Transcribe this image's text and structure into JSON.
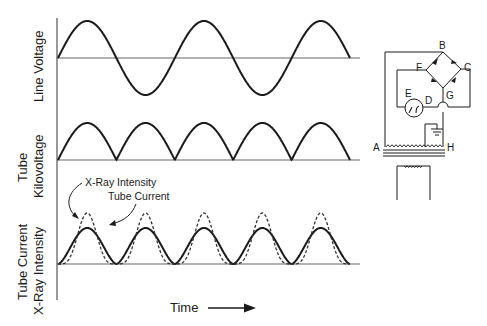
{
  "figure": {
    "type": "waveform-diagram",
    "x_axis_label": "Time",
    "panels": [
      {
        "id": "line-voltage",
        "label": "Line Voltage",
        "waveform": "full sine (AC)",
        "cycles": 2.5
      },
      {
        "id": "tube-kilovoltage",
        "label_line1": "Tube",
        "label_line2": "Kilovoltage",
        "waveform": "full-wave rectified sine",
        "pulses": 5
      },
      {
        "id": "current-intensity",
        "label_line1": "Tube Current",
        "label_line2": "X-Ray Intensity",
        "waveforms": [
          "Tube Current (solid)",
          "X-Ray Intensity (dashed)"
        ],
        "pulses": 5
      }
    ],
    "annotations": {
      "xray_intensity": "X-Ray Intensity",
      "tube_current": "Tube Current"
    }
  },
  "circuit": {
    "title": "Full-wave bridge rectifier circuit",
    "nodes": {
      "A": "A",
      "B": "B",
      "C": "C",
      "D": "D",
      "E": "E",
      "F": "F",
      "G": "G",
      "H": "H"
    }
  },
  "colors": {
    "ink": "#1a1a1a",
    "axis": "#555555",
    "background": "#ffffff"
  }
}
